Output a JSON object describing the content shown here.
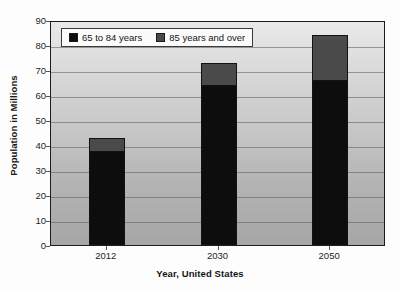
{
  "chart_data": {
    "type": "bar",
    "subtype": "stacked-vertical",
    "title": "",
    "xlabel": "Year, United States",
    "ylabel": "Population in Millions",
    "categories": [
      "2012",
      "2030",
      "2050"
    ],
    "series": [
      {
        "name": "65 to 84 years",
        "values": [
          37.5,
          64,
          66
        ],
        "color": "#0d0d0d"
      },
      {
        "name": "85 years and over",
        "values": [
          5.5,
          9,
          18
        ],
        "color": "#4a4a4a"
      }
    ],
    "totals": [
      43,
      73,
      84
    ],
    "ylim": [
      0,
      90
    ],
    "yticks": [
      0,
      10,
      20,
      30,
      40,
      50,
      60,
      70,
      80,
      90
    ],
    "ytick_labels": [
      "0",
      "10",
      "20",
      "30",
      "40",
      "50",
      "60",
      "70",
      "80",
      "90"
    ],
    "grid": true,
    "grid_axis": "y",
    "legend_position": "top-left-inside",
    "legend_entries": [
      "65 to 84 years",
      "85 years and over"
    ],
    "plot_background": "gray-vertical-gradient",
    "bar_border_color": "#121212"
  },
  "axes": {
    "y_title": "Population in Millions",
    "x_title": "Year, United States"
  },
  "legend": {
    "items": [
      {
        "label": "65 to 84 years",
        "swatch_name": "legend-swatch-65-to-84"
      },
      {
        "label": "85 years and over",
        "swatch_name": "legend-swatch-85-and-over"
      }
    ]
  }
}
